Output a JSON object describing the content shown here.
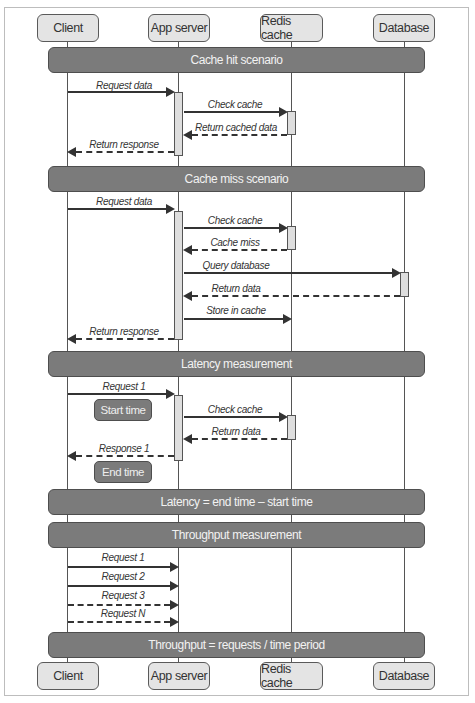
{
  "participants": [
    {
      "name": "Client",
      "x": 67
    },
    {
      "name": "App server",
      "x": 178
    },
    {
      "name": "Redis cache",
      "x": 291
    },
    {
      "name": "Database",
      "x": 404
    }
  ],
  "sections": {
    "cache_hit": "Cache hit scenario",
    "cache_miss": "Cache miss scenario",
    "latency": "Latency measurement",
    "latency_formula": "Latency = end time – start time",
    "throughput": "Throughput measurement",
    "throughput_formula": "Throughput = requests / time period"
  },
  "cache_hit": {
    "request_data": "Request data",
    "check_cache": "Check cache",
    "return_cached_data": "Return cached data",
    "return_response": "Return response"
  },
  "cache_miss": {
    "request_data": "Request data",
    "check_cache": "Check cache",
    "cache_miss": "Cache miss",
    "query_database": "Query database",
    "return_data": "Return data",
    "store_in_cache": "Store in cache",
    "return_response": "Return response"
  },
  "latency": {
    "request_1": "Request 1",
    "start_time": "Start time",
    "check_cache": "Check cache",
    "return_data": "Return data",
    "response_1": "Response 1",
    "end_time": "End time"
  },
  "throughput": {
    "requests": [
      "Request 1",
      "Request 2",
      "Request 3",
      "Request N"
    ]
  }
}
